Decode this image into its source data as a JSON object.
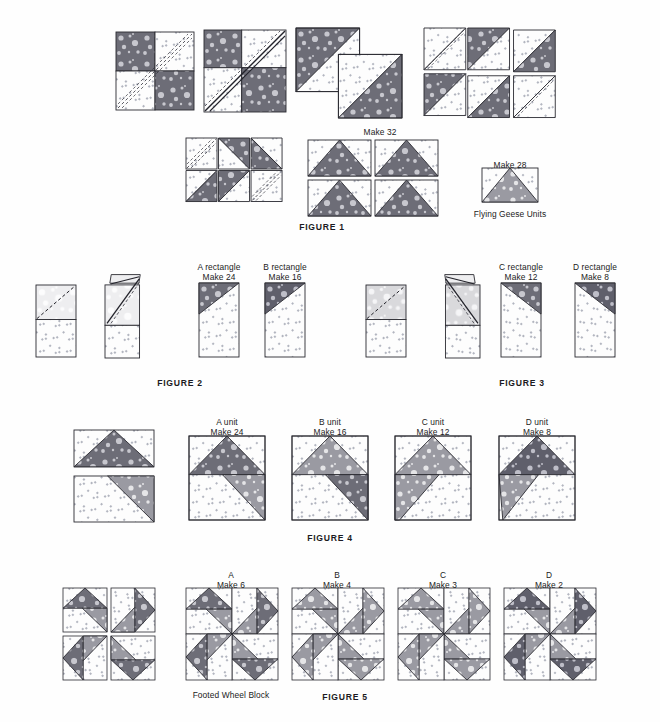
{
  "document": {
    "title": "Footed Wheel Block Piecing Diagrams",
    "background_color": "#fefefe",
    "text_color": "#1b1b22"
  },
  "palette": {
    "dark_print": "#6d6d77",
    "dark_print_alt": "#5f5f6b",
    "medium_print": "#9a9aa2",
    "light_print": "#d9d9dc",
    "pale_print": "#eeeef0",
    "background_fabric": "#fdfdfd",
    "outline": "#2a2a31",
    "stitch_line": "#3a3a42"
  },
  "figures": [
    {
      "id": "figure-1",
      "caption": "FIGURE 1",
      "caption_x": 322,
      "caption_y": 222,
      "labels": [
        {
          "name": "make-32-label",
          "text": "Make 32",
          "x": 380,
          "y": 127
        },
        {
          "name": "make-28-label",
          "text": "Make 28",
          "x": 510,
          "y": 160
        },
        {
          "name": "flying-geese-units-label",
          "text": "Flying Geese Units",
          "x": 510,
          "y": 209
        }
      ],
      "units": [
        {
          "name": "four-patch-marked",
          "type": "fourpatch_marked",
          "x": 116,
          "y": 32,
          "w": 78,
          "h": 78
        },
        {
          "name": "four-patch-stitched",
          "type": "fourpatch_stitched",
          "x": 204,
          "y": 30,
          "w": 82,
          "h": 82
        },
        {
          "name": "hst-pair-cut",
          "type": "hst_pair",
          "x": 296,
          "y": 28,
          "w": 106,
          "h": 90
        },
        {
          "name": "hst-pinwheel-open",
          "type": "hst_quad_open",
          "x": 424,
          "y": 28,
          "w": 116,
          "h": 92
        },
        {
          "name": "pinwheel-assembled",
          "type": "pinwheel_marked",
          "x": 186,
          "y": 138,
          "w": 94,
          "h": 82
        },
        {
          "name": "flying-geese-grid",
          "type": "geese_grid",
          "x": 308,
          "y": 140,
          "w": 130,
          "h": 76
        },
        {
          "name": "flying-geese-single",
          "type": "geese_single",
          "x": 482,
          "y": 168,
          "w": 56,
          "h": 34
        }
      ]
    },
    {
      "id": "figure-2",
      "caption": "FIGURE 2",
      "caption_x": 180,
      "caption_y": 378,
      "labels": [
        {
          "name": "a-rectangle-label",
          "text": "A rectangle",
          "x": 219,
          "y": 262
        },
        {
          "name": "a-rectangle-make",
          "text": "Make 24",
          "x": 219,
          "y": 272
        },
        {
          "name": "b-rectangle-label",
          "text": "B rectangle",
          "x": 285,
          "y": 262
        },
        {
          "name": "b-rectangle-make",
          "text": "Make 16",
          "x": 285,
          "y": 272
        }
      ],
      "units": [
        {
          "name": "rect-base-marked-a",
          "type": "rect_marked",
          "x": 36,
          "y": 285,
          "w": 40,
          "h": 72,
          "top_fill": "pale"
        },
        {
          "name": "rect-folded-a",
          "type": "rect_folded",
          "x": 105,
          "y": 272,
          "w": 48,
          "h": 86,
          "top_fill": "pale"
        },
        {
          "name": "a-rectangle-unit",
          "type": "rect_finished",
          "x": 199,
          "y": 283,
          "w": 40,
          "h": 74,
          "tri_fill": "dark"
        },
        {
          "name": "b-rectangle-unit",
          "type": "rect_finished",
          "x": 265,
          "y": 283,
          "w": 40,
          "h": 74,
          "tri_fill": "darkalt"
        }
      ]
    },
    {
      "id": "figure-3",
      "caption": "FIGURE 3",
      "caption_x": 522,
      "caption_y": 378,
      "labels": [
        {
          "name": "c-rectangle-label",
          "text": "C rectangle",
          "x": 521,
          "y": 262
        },
        {
          "name": "c-rectangle-make",
          "text": "Make 12",
          "x": 521,
          "y": 272
        },
        {
          "name": "d-rectangle-label",
          "text": "D rectangle",
          "x": 595,
          "y": 262
        },
        {
          "name": "d-rectangle-make",
          "text": "Make 8",
          "x": 595,
          "y": 272
        }
      ],
      "units": [
        {
          "name": "rect-base-marked-c",
          "type": "rect_marked",
          "x": 366,
          "y": 285,
          "w": 40,
          "h": 72,
          "top_fill": "light"
        },
        {
          "name": "rect-folded-c",
          "type": "rect_folded_r",
          "x": 432,
          "y": 272,
          "w": 48,
          "h": 86,
          "top_fill": "light"
        },
        {
          "name": "c-rectangle-unit",
          "type": "rect_finished_r",
          "x": 501,
          "y": 283,
          "w": 40,
          "h": 74,
          "tri_fill": "dark"
        },
        {
          "name": "d-rectangle-unit",
          "type": "rect_finished_r",
          "x": 575,
          "y": 283,
          "w": 40,
          "h": 74,
          "tri_fill": "darkalt"
        }
      ]
    },
    {
      "id": "figure-4",
      "caption": "FIGURE 4",
      "caption_x": 330,
      "caption_y": 533,
      "labels": [
        {
          "name": "a-unit-label",
          "text": "A unit",
          "x": 227,
          "y": 417
        },
        {
          "name": "a-unit-make",
          "text": "Make 24",
          "x": 227,
          "y": 427
        },
        {
          "name": "b-unit-label",
          "text": "B unit",
          "x": 330,
          "y": 417
        },
        {
          "name": "b-unit-make",
          "text": "Make 16",
          "x": 330,
          "y": 427
        },
        {
          "name": "c-unit-label",
          "text": "C unit",
          "x": 433,
          "y": 417
        },
        {
          "name": "c-unit-make",
          "text": "Make 12",
          "x": 433,
          "y": 427
        },
        {
          "name": "d-unit-label",
          "text": "D unit",
          "x": 537,
          "y": 417
        },
        {
          "name": "d-unit-make",
          "text": "Make 8",
          "x": 537,
          "y": 427
        }
      ],
      "units": [
        {
          "name": "exploded-unit-parts",
          "type": "exploded_unit",
          "x": 74,
          "y": 430,
          "w": 80,
          "h": 92
        },
        {
          "name": "a-unit",
          "type": "joined_unit",
          "x": 189,
          "y": 436,
          "w": 76,
          "h": 84,
          "tri_fill": "dark"
        },
        {
          "name": "b-unit",
          "type": "joined_unit_b",
          "x": 292,
          "y": 436,
          "w": 76,
          "h": 84,
          "tri_fill": "medium"
        },
        {
          "name": "c-unit",
          "type": "joined_unit_c",
          "x": 395,
          "y": 436,
          "w": 76,
          "h": 84,
          "tri_fill": "medium"
        },
        {
          "name": "d-unit",
          "type": "joined_unit_d",
          "x": 499,
          "y": 436,
          "w": 76,
          "h": 84,
          "tri_fill": "darkalt"
        }
      ]
    },
    {
      "id": "figure-5",
      "caption": "FIGURE 5",
      "caption_x": 345,
      "caption_y": 692,
      "labels": [
        {
          "name": "block-a-label",
          "text": "A",
          "x": 231,
          "y": 570
        },
        {
          "name": "block-a-make",
          "text": "Make 6",
          "x": 231,
          "y": 580
        },
        {
          "name": "block-b-label",
          "text": "B",
          "x": 337,
          "y": 570
        },
        {
          "name": "block-b-make",
          "text": "Make 4",
          "x": 337,
          "y": 580
        },
        {
          "name": "block-c-label",
          "text": "C",
          "x": 443,
          "y": 570
        },
        {
          "name": "block-c-make",
          "text": "Make 3",
          "x": 443,
          "y": 580
        },
        {
          "name": "block-d-label",
          "text": "D",
          "x": 549,
          "y": 570
        },
        {
          "name": "block-d-make",
          "text": "Make 2",
          "x": 549,
          "y": 580
        },
        {
          "name": "footed-wheel-block-label",
          "text": "Footed Wheel Block",
          "x": 231,
          "y": 690
        }
      ],
      "units": [
        {
          "name": "block-exploded",
          "type": "block_exploded",
          "x": 63,
          "y": 588,
          "w": 92,
          "h": 92
        },
        {
          "name": "block-a",
          "type": "block_whole",
          "x": 186,
          "y": 588,
          "w": 92,
          "h": 92,
          "tri_fill": "dark"
        },
        {
          "name": "block-b",
          "type": "block_whole",
          "x": 292,
          "y": 588,
          "w": 92,
          "h": 92,
          "tri_fill": "medium"
        },
        {
          "name": "block-c",
          "type": "block_whole",
          "x": 398,
          "y": 588,
          "w": 92,
          "h": 92,
          "tri_fill": "medlt"
        },
        {
          "name": "block-d",
          "type": "block_whole",
          "x": 504,
          "y": 588,
          "w": 92,
          "h": 92,
          "tri_fill": "darkalt"
        }
      ]
    }
  ]
}
